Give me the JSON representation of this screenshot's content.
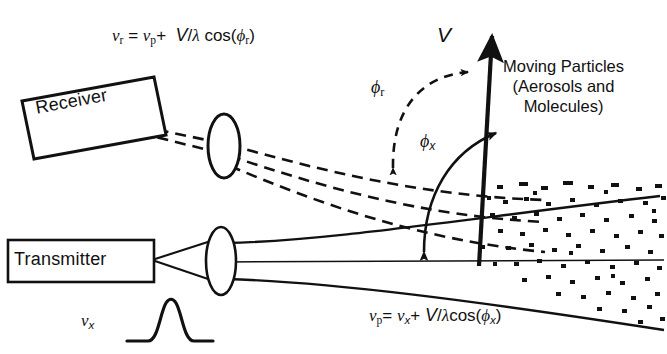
{
  "figure": {
    "kind": "doppler-lidar-scattering-geometry",
    "background_color": "#ffffff",
    "ink_color": "#111111"
  },
  "instruments": {
    "receiver": {
      "label": "Receiver",
      "rotation_deg": -10.5,
      "lens_name": "receiver-lens"
    },
    "transmitter": {
      "label": "Transmitter",
      "rotation_deg": 0,
      "lens_name": "transmitter-lens"
    }
  },
  "annotations": {
    "moving_particles": {
      "line1": "Moving Particles",
      "line2": "(Aerosols and",
      "line3": "Molecules)"
    },
    "velocity_vector_label": "V",
    "angle_receiver_label": "ϕ",
    "angle_receiver_sub": "r",
    "angle_transmit_label": "ϕ",
    "angle_transmit_sub": "x",
    "pulse_label_nu": "ν",
    "pulse_label_sub": "x"
  },
  "formulas": {
    "receiver": {
      "plain": "ν_r = ν_p + V/λ cos(ϕ_r)",
      "tokens": {
        "nu1": "ν",
        "sub1": "r",
        "eq": "=",
        "nu2": "ν",
        "sub2": "p",
        "plus": "+",
        "V": "V",
        "slash": "/",
        "lambda": "λ",
        "cos": "cos(",
        "phi": "ϕ",
        "sub3": "r",
        "close": ")"
      }
    },
    "transmitted": {
      "plain": "ν_p = ν_x + V/λcos(ϕ_x)",
      "tokens": {
        "nu1": "ν",
        "sub1": "p",
        "eq": "=",
        "nu2": "ν",
        "sub2": "x",
        "plus": "+",
        "V": "V",
        "slash": "/",
        "lambda": "λ",
        "cos": "cos(",
        "phi": "ϕ",
        "sub3": "x",
        "close": ")"
      }
    }
  },
  "graphics": {
    "receiver_beam_style": "dashed",
    "transmitter_beam_style": "solid",
    "particle_cloud": "speckled dot field at right",
    "pulse_shape": "gaussian"
  }
}
